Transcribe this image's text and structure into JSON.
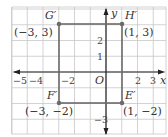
{
  "figure": {
    "type": "coordinate-plane",
    "axes": {
      "x_label": "x",
      "y_label": "y",
      "origin_label": "O",
      "x_ticks": [
        {
          "value": -5,
          "label": "−5"
        },
        {
          "value": -4,
          "label": "−4"
        },
        {
          "value": -2,
          "label": "−2"
        },
        {
          "value": 2,
          "label": "2"
        },
        {
          "value": 3,
          "label": "3"
        }
      ],
      "y_ticks": [
        {
          "value": 2,
          "label": "2"
        },
        {
          "value": 1,
          "label": "1"
        },
        {
          "value": -3,
          "label": "−3"
        }
      ],
      "x_range": [
        -6,
        3.7
      ],
      "y_range": [
        -3.9,
        4.1
      ]
    },
    "grid": {
      "on": true,
      "color": "#c8c8c8"
    },
    "colors": {
      "shape": "#6b6b6b",
      "axis": "#222222",
      "text": "#333333"
    },
    "rectangle": {
      "vertices": [
        {
          "name": "G′",
          "x": -3,
          "y": 3,
          "coord_label": "(−3, 3)"
        },
        {
          "name": "H′",
          "x": 1,
          "y": 3,
          "coord_label": "(1, 3)"
        },
        {
          "name": "E′",
          "x": 1,
          "y": -2,
          "coord_label": "(1, −2)"
        },
        {
          "name": "F′",
          "x": -3,
          "y": -2,
          "coord_label": "(−3, −2)"
        }
      ]
    }
  }
}
